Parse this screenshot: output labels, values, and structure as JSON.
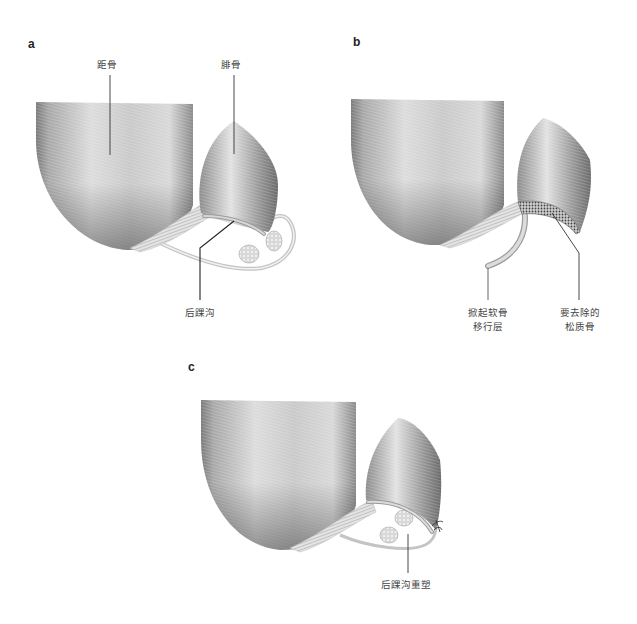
{
  "figure": {
    "panels": [
      {
        "letter": "a",
        "labels": {
          "talus": "距骨",
          "fibula": "腓骨",
          "groove": "后踝沟"
        }
      },
      {
        "letter": "b",
        "labels": {
          "flap_line1": "掀起软骨",
          "flap_line2": "移行层",
          "remove_line1": "要去除的",
          "remove_line2": "松质骨"
        }
      },
      {
        "letter": "c",
        "labels": {
          "reshaped": "后踝沟重塑"
        }
      }
    ],
    "colors": {
      "bone_dark": "#6e6e6e",
      "bone_light": "#e6e6e6",
      "outline": "#b8b8b8",
      "leader_line": "#333333",
      "text": "#444444"
    }
  }
}
